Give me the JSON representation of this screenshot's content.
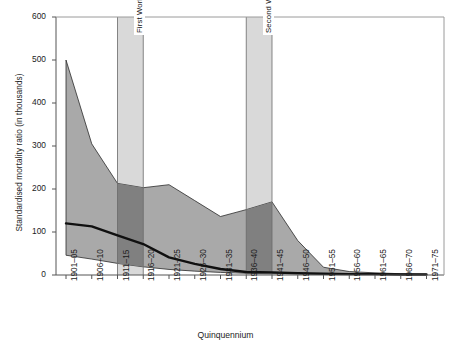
{
  "chart_data": {
    "type": "area",
    "title": "",
    "xlabel": "Quinquennium",
    "ylabel": "Standardised mortality ratio (in thousands)",
    "ylim": [
      0,
      600
    ],
    "yticks": [
      0,
      100,
      200,
      300,
      400,
      500,
      600
    ],
    "grid": false,
    "legend": "none",
    "categories": [
      "1901–05",
      "1906–10",
      "1911–15",
      "1916–20",
      "1921–25",
      "1926–30",
      "1931–35",
      "1936–40",
      "1941–45",
      "1946–50",
      "1951–55",
      "1956–60",
      "1961–65",
      "1966–70",
      "1971–75"
    ],
    "series": [
      {
        "name": "Upper bound",
        "values": [
          500,
          305,
          213,
          203,
          210,
          173,
          136,
          152,
          170,
          80,
          18,
          8,
          5,
          3,
          2
        ]
      },
      {
        "name": "Median",
        "values": [
          120,
          113,
          92,
          72,
          41,
          26,
          14,
          7,
          6,
          4,
          3,
          2,
          2,
          1,
          1
        ]
      },
      {
        "name": "Lower bound",
        "values": [
          46,
          37,
          27,
          19,
          13,
          9,
          6,
          4,
          3,
          3,
          2,
          2,
          1,
          1,
          1
        ]
      }
    ],
    "annotations": [
      {
        "label": "First World War",
        "kind": "vertical-band",
        "from_category": "1911–15",
        "to_category": "1916–20"
      },
      {
        "label": "Second World War",
        "kind": "vertical-band",
        "from_category": "1936–40",
        "to_category": "1941–45"
      }
    ],
    "colors": {
      "band_fill": "#a9a9a9",
      "band_overlap_fill": "#808080",
      "war_band_fill": "#d9d9d9",
      "median_line": "#101010",
      "axis": "#555555",
      "background": "#ffffff"
    }
  },
  "axes": {
    "y_title": "Standardised mortality ratio (in thousands)",
    "x_title": "Quinquennium",
    "y_tick_labels": [
      "600",
      "500",
      "400",
      "300",
      "200",
      "100",
      "0"
    ],
    "x_tick_labels": [
      "1901–05",
      "1906–10",
      "1911–15",
      "1916–20",
      "1921–25",
      "1926–30",
      "1931–35",
      "1936–40",
      "1941–45",
      "1946–50",
      "1951–55",
      "1956–60",
      "1961–65",
      "1966–70",
      "1971–75"
    ]
  },
  "annotations": {
    "first_world_war": "First World War",
    "second_world_war": "Second World War"
  }
}
